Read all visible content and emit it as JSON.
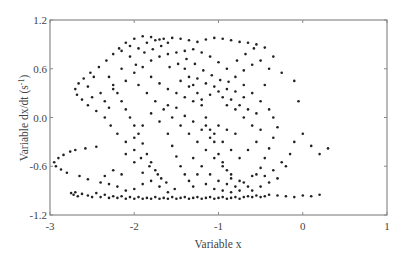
{
  "chart_data": {
    "type": "scatter",
    "title": "",
    "xlabel": "Variable x",
    "ylabel": "Variable dx/dt (s",
    "ylabel_superscript": "-1",
    "ylabel_suffix": ")",
    "xlim": [
      -3,
      1
    ],
    "ylim": [
      -1.2,
      1.2
    ],
    "xticks": [
      -3,
      -2,
      -1,
      0,
      1
    ],
    "xtick_labels": [
      "-3",
      "-2",
      "-1",
      "0",
      "1"
    ],
    "yticks": [
      1.2,
      0.6,
      0.0,
      -0.6,
      -1.2
    ],
    "ytick_labels": [
      "1.2",
      "0.6",
      "0.0",
      "-0.6",
      "-1.2"
    ],
    "grid": false,
    "legend": null,
    "marker": {
      "size": 1.3,
      "color": "#222222"
    },
    "points": [
      [
        -2.95,
        -0.55
      ],
      [
        -2.93,
        -0.6
      ],
      [
        -2.9,
        -0.5
      ],
      [
        -2.87,
        -0.64
      ],
      [
        -2.84,
        -0.46
      ],
      [
        -2.8,
        -0.68
      ],
      [
        -2.76,
        -0.42
      ],
      [
        -2.7,
        -0.4
      ],
      [
        -2.65,
        -0.72
      ],
      [
        -2.58,
        -0.38
      ],
      [
        -2.55,
        -0.76
      ],
      [
        -2.45,
        -0.36
      ],
      [
        -2.4,
        -0.8
      ],
      [
        -2.75,
        -0.93
      ],
      [
        -2.72,
        -0.95
      ],
      [
        -2.7,
        -0.92
      ],
      [
        -2.67,
        -0.97
      ],
      [
        -2.62,
        -0.94
      ],
      [
        -2.55,
        -0.96
      ],
      [
        -2.5,
        -0.98
      ],
      [
        -2.45,
        -0.93
      ],
      [
        -2.4,
        -0.98
      ],
      [
        -2.35,
        -0.95
      ],
      [
        -2.3,
        -0.99
      ],
      [
        -2.25,
        -0.97
      ],
      [
        -2.2,
        -0.99
      ],
      [
        -2.15,
        -0.97
      ],
      [
        -2.1,
        -1.0
      ],
      [
        -2.05,
        -0.98
      ],
      [
        -2.0,
        -1.0
      ],
      [
        -1.95,
        -0.98
      ],
      [
        -1.9,
        -1.0
      ],
      [
        -1.85,
        -0.99
      ],
      [
        -1.8,
        -1.0
      ],
      [
        -1.75,
        -0.98
      ],
      [
        -1.7,
        -1.0
      ],
      [
        -1.65,
        -0.99
      ],
      [
        -1.6,
        -1.0
      ],
      [
        -1.55,
        -0.98
      ],
      [
        -1.5,
        -1.0
      ],
      [
        -1.45,
        -0.99
      ],
      [
        -1.4,
        -0.98
      ],
      [
        -1.35,
        -1.0
      ],
      [
        -1.3,
        -0.99
      ],
      [
        -1.25,
        -0.98
      ],
      [
        -1.2,
        -1.0
      ],
      [
        -1.15,
        -0.99
      ],
      [
        -1.1,
        -0.98
      ],
      [
        -1.05,
        -1.0
      ],
      [
        -1.0,
        -0.99
      ],
      [
        -0.95,
        -0.98
      ],
      [
        -0.9,
        -1.0
      ],
      [
        -0.85,
        -0.99
      ],
      [
        -0.8,
        -0.98
      ],
      [
        -0.75,
        -1.0
      ],
      [
        -0.7,
        -0.98
      ],
      [
        -0.65,
        -0.97
      ],
      [
        -0.6,
        -0.98
      ],
      [
        -0.55,
        -0.96
      ],
      [
        -0.5,
        -0.98
      ],
      [
        -0.45,
        -0.97
      ],
      [
        -0.4,
        -0.95
      ],
      [
        -0.3,
        -0.96
      ],
      [
        -0.2,
        -0.97
      ],
      [
        -0.1,
        -0.98
      ],
      [
        0.0,
        -0.96
      ],
      [
        0.1,
        -0.97
      ],
      [
        0.2,
        -0.95
      ],
      [
        -2.7,
        0.35
      ],
      [
        -2.68,
        0.28
      ],
      [
        -2.66,
        0.42
      ],
      [
        -2.62,
        0.22
      ],
      [
        -2.6,
        0.48
      ],
      [
        -2.55,
        0.15
      ],
      [
        -2.52,
        0.55
      ],
      [
        -2.45,
        0.08
      ],
      [
        -2.42,
        0.62
      ],
      [
        -2.35,
        0.0
      ],
      [
        -2.33,
        0.7
      ],
      [
        -2.28,
        -0.1
      ],
      [
        -2.25,
        0.78
      ],
      [
        -2.2,
        -0.2
      ],
      [
        -2.18,
        0.85
      ],
      [
        -2.1,
        -0.3
      ],
      [
        -2.1,
        0.92
      ],
      [
        -2.0,
        -0.4
      ],
      [
        -2.0,
        0.97
      ],
      [
        -1.92,
        -0.5
      ],
      [
        -1.9,
        1.0
      ],
      [
        -1.82,
        -0.6
      ],
      [
        -1.8,
        0.99
      ],
      [
        -1.72,
        -0.7
      ],
      [
        -1.7,
        0.96
      ],
      [
        -1.62,
        -0.8
      ],
      [
        -1.6,
        0.92
      ],
      [
        -1.52,
        -0.88
      ],
      [
        -2.3,
        0.5
      ],
      [
        -2.25,
        0.4
      ],
      [
        -2.2,
        0.3
      ],
      [
        -2.15,
        0.2
      ],
      [
        -2.1,
        0.1
      ],
      [
        -2.05,
        0.0
      ],
      [
        -2.0,
        -0.1
      ],
      [
        -1.95,
        -0.2
      ],
      [
        -1.9,
        -0.32
      ],
      [
        -1.85,
        -0.45
      ],
      [
        -1.8,
        -0.55
      ],
      [
        -1.75,
        -0.65
      ],
      [
        -1.68,
        -0.75
      ],
      [
        -2.25,
        0.35
      ],
      [
        -2.15,
        0.6
      ],
      [
        -2.05,
        0.75
      ],
      [
        -1.95,
        0.85
      ],
      [
        -1.85,
        0.92
      ],
      [
        -1.75,
        0.95
      ],
      [
        -1.65,
        0.97
      ],
      [
        -1.55,
        0.98
      ],
      [
        -1.45,
        0.97
      ],
      [
        -1.35,
        0.95
      ],
      [
        -1.25,
        0.93
      ],
      [
        -1.15,
        0.96
      ],
      [
        -1.05,
        0.98
      ],
      [
        -0.95,
        0.97
      ],
      [
        -0.85,
        0.95
      ],
      [
        -0.75,
        0.93
      ],
      [
        -0.65,
        0.92
      ],
      [
        -0.55,
        0.9
      ],
      [
        -0.45,
        0.86
      ],
      [
        -2.4,
        0.3
      ],
      [
        -2.35,
        0.2
      ],
      [
        -2.3,
        0.12
      ],
      [
        -2.1,
        0.45
      ],
      [
        -2.0,
        0.55
      ],
      [
        -1.9,
        0.62
      ],
      [
        -1.8,
        0.7
      ],
      [
        -1.7,
        0.75
      ],
      [
        -1.6,
        0.78
      ],
      [
        -1.5,
        0.8
      ],
      [
        -1.4,
        0.82
      ],
      [
        -1.3,
        0.84
      ],
      [
        -1.2,
        0.8
      ],
      [
        -1.1,
        0.75
      ],
      [
        -1.0,
        0.68
      ],
      [
        -0.9,
        0.6
      ],
      [
        -0.8,
        0.5
      ],
      [
        -0.7,
        0.4
      ],
      [
        -0.6,
        0.3
      ],
      [
        -0.5,
        0.2
      ],
      [
        -0.4,
        0.1
      ],
      [
        -0.35,
        0.0
      ],
      [
        -1.95,
        0.4
      ],
      [
        -1.85,
        0.3
      ],
      [
        -1.75,
        0.2
      ],
      [
        -1.65,
        0.1
      ],
      [
        -1.55,
        0.0
      ],
      [
        -1.45,
        -0.1
      ],
      [
        -1.35,
        -0.2
      ],
      [
        -1.25,
        -0.3
      ],
      [
        -1.15,
        -0.4
      ],
      [
        -1.05,
        -0.5
      ],
      [
        -0.95,
        -0.6
      ],
      [
        -0.85,
        -0.7
      ],
      [
        -0.75,
        -0.78
      ],
      [
        -0.65,
        -0.85
      ],
      [
        -1.8,
        0.5
      ],
      [
        -1.7,
        0.42
      ],
      [
        -1.6,
        0.35
      ],
      [
        -1.5,
        0.3
      ],
      [
        -1.4,
        0.25
      ],
      [
        -1.3,
        0.2
      ],
      [
        -1.2,
        0.22
      ],
      [
        -1.1,
        0.28
      ],
      [
        -1.0,
        0.32
      ],
      [
        -0.9,
        0.35
      ],
      [
        -0.8,
        0.32
      ],
      [
        -0.7,
        0.25
      ],
      [
        -1.4,
        0.6
      ],
      [
        -1.35,
        0.5
      ],
      [
        -1.3,
        0.4
      ],
      [
        -1.25,
        0.3
      ],
      [
        -1.2,
        0.15
      ],
      [
        -1.15,
        0.0
      ],
      [
        -1.1,
        -0.15
      ],
      [
        -1.05,
        -0.3
      ],
      [
        -1.0,
        -0.45
      ],
      [
        -0.95,
        -0.55
      ],
      [
        -0.9,
        -0.65
      ],
      [
        -0.85,
        -0.75
      ],
      [
        -1.6,
        -0.2
      ],
      [
        -1.55,
        -0.35
      ],
      [
        -1.5,
        -0.48
      ],
      [
        -1.45,
        -0.6
      ],
      [
        -1.4,
        -0.7
      ],
      [
        -1.35,
        -0.78
      ],
      [
        -1.3,
        -0.85
      ],
      [
        -1.3,
        -0.5
      ],
      [
        -1.2,
        -0.6
      ],
      [
        -1.1,
        -0.7
      ],
      [
        -1.0,
        -0.78
      ],
      [
        -0.9,
        -0.82
      ],
      [
        -0.8,
        -0.85
      ],
      [
        -0.7,
        -0.8
      ],
      [
        -0.6,
        -0.72
      ],
      [
        -0.5,
        -0.62
      ],
      [
        -0.45,
        -0.5
      ],
      [
        -0.4,
        -0.38
      ],
      [
        -0.35,
        -0.25
      ],
      [
        -0.3,
        -0.12
      ],
      [
        -0.6,
        -0.9
      ],
      [
        -0.5,
        -0.85
      ],
      [
        -0.4,
        -0.8
      ],
      [
        -0.3,
        -0.75
      ],
      [
        -0.2,
        -0.6
      ],
      [
        -0.15,
        -0.45
      ],
      [
        -0.1,
        -0.3
      ],
      [
        0.0,
        -0.2
      ],
      [
        0.1,
        -0.35
      ],
      [
        0.2,
        -0.45
      ],
      [
        0.3,
        -0.38
      ],
      [
        -0.55,
        -0.3
      ],
      [
        -0.65,
        -0.4
      ],
      [
        -0.75,
        -0.5
      ],
      [
        -0.85,
        -0.4
      ],
      [
        -0.95,
        -0.3
      ],
      [
        -1.05,
        -0.2
      ],
      [
        -1.15,
        -0.1
      ],
      [
        -0.7,
        0.0
      ],
      [
        -0.8,
        0.1
      ],
      [
        -0.9,
        0.15
      ],
      [
        -0.6,
        -0.1
      ],
      [
        -0.5,
        -0.15
      ],
      [
        -0.45,
        0.4
      ],
      [
        -0.4,
        0.6
      ],
      [
        -0.35,
        0.75
      ],
      [
        -0.5,
        0.7
      ],
      [
        -0.6,
        0.65
      ],
      [
        -0.7,
        0.58
      ],
      [
        -0.25,
        0.55
      ],
      [
        -0.1,
        0.45
      ],
      [
        -0.05,
        0.2
      ],
      [
        -2.5,
        0.25
      ],
      [
        -2.55,
        0.38
      ],
      [
        -2.48,
        0.5
      ],
      [
        -2.15,
        0.82
      ],
      [
        -2.05,
        0.88
      ],
      [
        -1.98,
        0.65
      ],
      [
        -1.88,
        0.8
      ],
      [
        -1.78,
        0.84
      ],
      [
        -1.68,
        0.88
      ],
      [
        -1.58,
        0.62
      ],
      [
        -1.48,
        0.66
      ],
      [
        -1.38,
        0.72
      ],
      [
        -1.28,
        0.66
      ],
      [
        -1.18,
        0.58
      ],
      [
        -1.08,
        0.52
      ],
      [
        -0.98,
        0.46
      ],
      [
        -0.88,
        0.44
      ],
      [
        -0.78,
        0.7
      ],
      [
        -0.68,
        0.78
      ],
      [
        -0.58,
        0.85
      ],
      [
        -2.0,
        -0.25
      ],
      [
        -1.9,
        -0.1
      ],
      [
        -1.8,
        0.05
      ],
      [
        -1.7,
        -0.05
      ],
      [
        -1.6,
        0.15
      ],
      [
        -1.5,
        0.12
      ],
      [
        -1.4,
        0.02
      ],
      [
        -1.3,
        -0.05
      ],
      [
        -1.2,
        -0.15
      ],
      [
        -1.1,
        -0.25
      ],
      [
        -1.0,
        -0.1
      ],
      [
        -0.9,
        -0.15
      ],
      [
        -0.8,
        -0.2
      ],
      [
        -2.1,
        -0.45
      ],
      [
        -2.0,
        -0.55
      ],
      [
        -1.9,
        -0.68
      ],
      [
        -1.8,
        -0.78
      ],
      [
        -1.7,
        -0.85
      ],
      [
        -1.6,
        -0.92
      ],
      [
        -1.9,
        -0.82
      ],
      [
        -2.0,
        -0.88
      ],
      [
        -2.1,
        -0.9
      ],
      [
        -2.2,
        -0.85
      ],
      [
        -2.3,
        -0.82
      ],
      [
        -2.35,
        -0.72
      ],
      [
        -2.25,
        -0.65
      ],
      [
        -2.15,
        -0.7
      ],
      [
        -1.25,
        -0.7
      ],
      [
        -1.15,
        -0.82
      ],
      [
        -1.05,
        -0.88
      ],
      [
        -0.95,
        -0.9
      ],
      [
        -0.85,
        -0.92
      ],
      [
        -0.75,
        -0.9
      ],
      [
        -0.55,
        -0.7
      ],
      [
        -0.45,
        -0.72
      ],
      [
        -0.35,
        -0.65
      ],
      [
        -0.25,
        -0.55
      ],
      [
        -1.45,
        0.45
      ],
      [
        -1.35,
        0.38
      ],
      [
        -1.25,
        0.48
      ],
      [
        -1.15,
        0.42
      ],
      [
        -1.05,
        0.38
      ],
      [
        -0.95,
        0.25
      ],
      [
        -0.85,
        0.22
      ],
      [
        -0.75,
        0.15
      ],
      [
        -0.65,
        0.1
      ],
      [
        -0.55,
        0.05
      ]
    ]
  },
  "axes": {
    "x_label": "Variable x",
    "y_label_main": "Variable dx/dt (s",
    "y_label_sup": "-1",
    "y_label_end": ")"
  }
}
